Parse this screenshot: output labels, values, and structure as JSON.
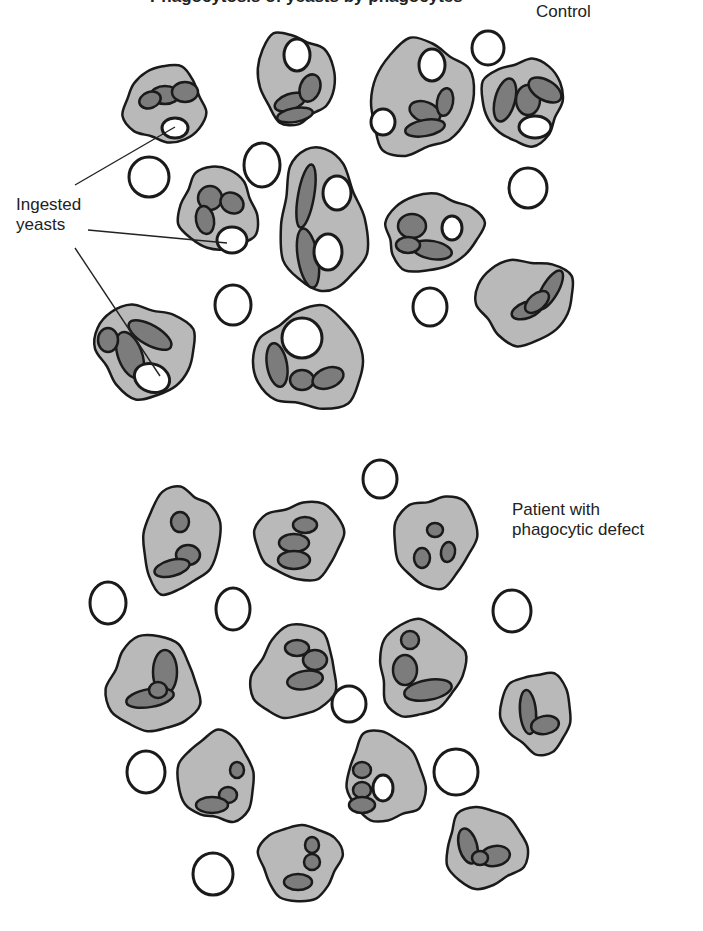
{
  "figure": {
    "title_partial": "Phagocytosis of yeasts by phagocytes",
    "colors": {
      "cytoplasm": "#b9b9b9",
      "nucleus": "#7c7c7c",
      "outline": "#1a1a1a",
      "yeast": "#ffffff"
    }
  },
  "labels": {
    "control": "Control",
    "patient_line1": "Patient with",
    "patient_line2": "phagocytic defect",
    "ingested_line1": "Ingested",
    "ingested_line2": "yeasts"
  },
  "panels": [
    {
      "name": "control",
      "cells": [
        {
          "cx": 165,
          "cy": 105,
          "rx": 40,
          "ry": 38,
          "rot": 10,
          "nuclei": [
            [
              165,
              95,
              14,
              9,
              0
            ],
            [
              185,
              92,
              13,
              10,
              0
            ],
            [
              150,
              100,
              11,
              8,
              -20
            ]
          ],
          "yeasts": [
            [
              175,
              128,
              13,
              10,
              0
            ]
          ]
        },
        {
          "cx": 295,
          "cy": 78,
          "rx": 38,
          "ry": 45,
          "rot": -15,
          "nuclei": [
            [
              290,
              102,
              16,
              8,
              -20
            ],
            [
              310,
              88,
              10,
              14,
              20
            ],
            [
              295,
              115,
              18,
              7,
              -10
            ]
          ],
          "yeasts": [
            [
              297,
              55,
              13,
              16,
              0
            ]
          ]
        },
        {
          "cx": 420,
          "cy": 98,
          "rx": 50,
          "ry": 58,
          "rot": 25,
          "nuclei": [
            [
              425,
              112,
              16,
              10,
              20
            ],
            [
              445,
              102,
              8,
              14,
              10
            ],
            [
              425,
              128,
              20,
              8,
              -10
            ]
          ],
          "yeasts": [
            [
              432,
              65,
              13,
              16,
              0
            ],
            [
              383,
              122,
              12,
              13,
              0
            ]
          ]
        },
        {
          "cx": 523,
          "cy": 101,
          "rx": 40,
          "ry": 42,
          "rot": 0,
          "nuclei": [
            [
              505,
              100,
              10,
              22,
              15
            ],
            [
              528,
              100,
              12,
              15,
              0
            ],
            [
              545,
              90,
              18,
              10,
              30
            ]
          ],
          "yeasts": [
            [
              535,
              127,
              16,
              11,
              0
            ]
          ]
        },
        {
          "cx": 218,
          "cy": 210,
          "rx": 38,
          "ry": 42,
          "rot": -20,
          "nuclei": [
            [
              210,
              198,
              12,
              12,
              0
            ],
            [
              232,
              203,
              12,
              10,
              30
            ],
            [
              205,
              220,
              9,
              14,
              -10
            ]
          ],
          "yeasts": [
            [
              232,
              240,
              15,
              13,
              0
            ]
          ]
        },
        {
          "cx": 322,
          "cy": 222,
          "rx": 42,
          "ry": 72,
          "rot": -5,
          "nuclei": [
            [
              306,
              196,
              8,
              32,
              10
            ],
            [
              308,
              258,
              10,
              30,
              -10
            ]
          ],
          "yeasts": [
            [
              337,
              193,
              14,
              17,
              0
            ],
            [
              328,
              252,
              14,
              18,
              0
            ]
          ]
        },
        {
          "cx": 432,
          "cy": 232,
          "rx": 48,
          "ry": 38,
          "rot": -10,
          "nuclei": [
            [
              412,
              226,
              14,
              12,
              0
            ],
            [
              432,
              250,
              20,
              9,
              10
            ],
            [
              408,
              245,
              12,
              8,
              0
            ]
          ],
          "yeasts": [
            [
              452,
              228,
              10,
              12,
              0
            ]
          ]
        },
        {
          "cx": 525,
          "cy": 300,
          "rx": 48,
          "ry": 42,
          "rot": -5,
          "nuclei": [
            [
              550,
              290,
              8,
              22,
              30
            ],
            [
              527,
              310,
              16,
              8,
              -20
            ],
            [
              537,
              302,
              14,
              8,
              -40
            ]
          ],
          "yeasts": []
        },
        {
          "cx": 145,
          "cy": 350,
          "rx": 50,
          "ry": 45,
          "rot": 25,
          "nuclei": [
            [
              130,
              355,
              12,
              24,
              -20
            ],
            [
              150,
              335,
              24,
              10,
              30
            ],
            [
              108,
              340,
              10,
              12,
              0
            ]
          ],
          "yeasts": [
            [
              152,
              378,
              18,
              14,
              20
            ]
          ]
        },
        {
          "cx": 310,
          "cy": 360,
          "rx": 55,
          "ry": 50,
          "rot": 0,
          "nuclei": [
            [
              277,
              365,
              10,
              22,
              -10
            ],
            [
              302,
              380,
              12,
              10,
              0
            ],
            [
              328,
              378,
              16,
              10,
              -20
            ]
          ],
          "yeasts": [
            [
              302,
              338,
              20,
              20,
              0
            ]
          ]
        }
      ],
      "free_yeasts": [
        [
          149,
          177,
          20,
          20
        ],
        [
          262,
          165,
          18,
          22
        ],
        [
          488,
          48,
          16,
          17
        ],
        [
          528,
          188,
          19,
          20
        ],
        [
          233,
          305,
          18,
          20
        ],
        [
          430,
          307,
          17,
          19
        ]
      ]
    },
    {
      "name": "patient",
      "cells": [
        {
          "cx": 180,
          "cy": 540,
          "rx": 38,
          "ry": 52,
          "rot": 10,
          "nuclei": [
            [
              180,
              522,
              9,
              10,
              0
            ],
            [
              188,
              555,
              12,
              10,
              0
            ],
            [
              172,
              568,
              18,
              8,
              -15
            ]
          ],
          "yeasts": []
        },
        {
          "cx": 300,
          "cy": 540,
          "rx": 44,
          "ry": 38,
          "rot": -10,
          "nuclei": [
            [
              305,
              525,
              12,
              8,
              0
            ],
            [
              294,
              543,
              15,
              9,
              0
            ],
            [
              294,
              560,
              16,
              9,
              0
            ]
          ],
          "yeasts": []
        },
        {
          "cx": 435,
          "cy": 540,
          "rx": 40,
          "ry": 46,
          "rot": 25,
          "nuclei": [
            [
              435,
              530,
              8,
              7,
              0
            ],
            [
              422,
              558,
              8,
              10,
              0
            ],
            [
              448,
              552,
              7,
              10,
              10
            ]
          ],
          "yeasts": []
        },
        {
          "cx": 153,
          "cy": 685,
          "rx": 45,
          "ry": 48,
          "rot": -5,
          "nuclei": [
            [
              165,
              672,
              12,
              22,
              0
            ],
            [
              150,
              698,
              24,
              9,
              -10
            ],
            [
              158,
              690,
              9,
              8,
              0
            ]
          ],
          "yeasts": []
        },
        {
          "cx": 295,
          "cy": 673,
          "rx": 40,
          "ry": 48,
          "rot": 25,
          "nuclei": [
            [
              297,
              648,
              12,
              8,
              0
            ],
            [
              315,
              660,
              12,
              10,
              0
            ],
            [
              305,
              680,
              18,
              9,
              -10
            ]
          ],
          "yeasts": []
        },
        {
          "cx": 420,
          "cy": 668,
          "rx": 42,
          "ry": 48,
          "rot": 10,
          "nuclei": [
            [
              410,
              640,
              9,
              9,
              0
            ],
            [
              405,
              670,
              12,
              15,
              0
            ],
            [
              428,
              690,
              24,
              10,
              -10
            ]
          ],
          "yeasts": []
        },
        {
          "cx": 537,
          "cy": 712,
          "rx": 35,
          "ry": 40,
          "rot": -10,
          "nuclei": [
            [
              528,
              712,
              8,
              22,
              -5
            ],
            [
              545,
              725,
              14,
              9,
              -10
            ]
          ],
          "yeasts": []
        },
        {
          "cx": 217,
          "cy": 778,
          "rx": 38,
          "ry": 44,
          "rot": -10,
          "nuclei": [
            [
              237,
              770,
              7,
              8,
              0
            ],
            [
              228,
              795,
              9,
              8,
              0
            ],
            [
              212,
              805,
              16,
              8,
              0
            ]
          ],
          "yeasts": []
        },
        {
          "cx": 385,
          "cy": 778,
          "rx": 38,
          "ry": 45,
          "rot": -15,
          "nuclei": [
            [
              362,
              770,
              9,
              8,
              0
            ],
            [
              362,
              790,
              9,
              8,
              0
            ],
            [
              362,
              805,
              13,
              8,
              0
            ]
          ],
          "yeasts": [
            [
              383,
              788,
              10,
              13,
              0
            ]
          ]
        },
        {
          "cx": 485,
          "cy": 848,
          "rx": 40,
          "ry": 40,
          "rot": 0,
          "nuclei": [
            [
              468,
              846,
              9,
              18,
              -15
            ],
            [
              495,
              856,
              15,
              10,
              -10
            ],
            [
              480,
              858,
              8,
              7,
              0
            ]
          ],
          "yeasts": []
        },
        {
          "cx": 300,
          "cy": 862,
          "rx": 40,
          "ry": 38,
          "rot": -10,
          "nuclei": [
            [
              312,
              845,
              7,
              8,
              0
            ],
            [
              312,
              862,
              8,
              8,
              0
            ],
            [
              298,
              882,
              14,
              8,
              0
            ]
          ],
          "yeasts": []
        }
      ],
      "free_yeasts": [
        [
          108,
          603,
          18,
          21
        ],
        [
          233,
          609,
          17,
          21
        ],
        [
          380,
          479,
          17,
          19
        ],
        [
          512,
          611,
          19,
          21
        ],
        [
          349,
          704,
          17,
          18
        ],
        [
          146,
          772,
          19,
          21
        ],
        [
          456,
          772,
          22,
          23
        ],
        [
          213,
          874,
          20,
          21
        ]
      ]
    }
  ]
}
